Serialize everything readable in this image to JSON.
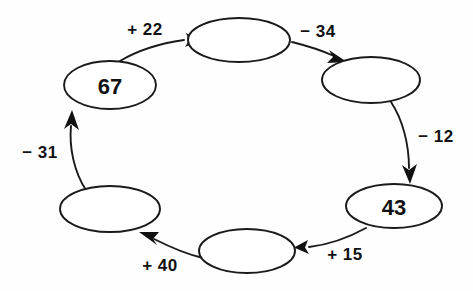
{
  "diagram": {
    "type": "cycle-flow-diagram",
    "background_color": "#fefefe",
    "stroke_color": "#1a1a1a",
    "text_color": "#111111",
    "node_count": 6,
    "edge_count": 6,
    "nodes": [
      {
        "id": "node-top",
        "label": "",
        "filled": false,
        "cx": 239,
        "cy": 40,
        "rx": 51,
        "ry": 22
      },
      {
        "id": "node-right-upper",
        "label": "",
        "filled": false,
        "cx": 371,
        "cy": 80,
        "rx": 49,
        "ry": 23
      },
      {
        "id": "node-right-lower",
        "label": "43",
        "filled": true,
        "cx": 394,
        "cy": 206,
        "rx": 48,
        "ry": 22
      },
      {
        "id": "node-bottom",
        "label": "",
        "filled": false,
        "cx": 247,
        "cy": 251,
        "rx": 48,
        "ry": 22
      },
      {
        "id": "node-left-lower",
        "label": "",
        "filled": false,
        "cx": 110,
        "cy": 209,
        "rx": 50,
        "ry": 23
      },
      {
        "id": "node-left-upper",
        "label": "67",
        "filled": true,
        "cx": 110,
        "cy": 85,
        "rx": 46,
        "ry": 24
      }
    ],
    "edges": [
      {
        "id": "edge-67-to-top",
        "from": "node-left-upper",
        "to": "node-top",
        "label": "+ 22",
        "operation": "add",
        "operand": 22,
        "label_x": 145,
        "label_y": 29
      },
      {
        "id": "edge-top-to-right-upper",
        "from": "node-top",
        "to": "node-right-upper",
        "label": "− 34",
        "operation": "subtract",
        "operand": 34,
        "label_x": 318,
        "label_y": 31
      },
      {
        "id": "edge-right-upper-to-43",
        "from": "node-right-upper",
        "to": "node-right-lower",
        "label": "− 12",
        "operation": "subtract",
        "operand": 12,
        "label_x": 436,
        "label_y": 136
      },
      {
        "id": "edge-43-to-bottom",
        "from": "node-right-lower",
        "to": "node-bottom",
        "label": "+ 15",
        "operation": "add",
        "operand": 15,
        "label_x": 345,
        "label_y": 254
      },
      {
        "id": "edge-bottom-to-left-lower",
        "from": "node-bottom",
        "to": "node-left-lower",
        "label": "+ 40",
        "operation": "add",
        "operand": 40,
        "label_x": 160,
        "label_y": 265
      },
      {
        "id": "edge-left-lower-to-67",
        "from": "node-left-lower",
        "to": "node-left-upper",
        "label": "− 31",
        "operation": "subtract",
        "operand": 31,
        "label_x": 40,
        "label_y": 152
      }
    ]
  }
}
